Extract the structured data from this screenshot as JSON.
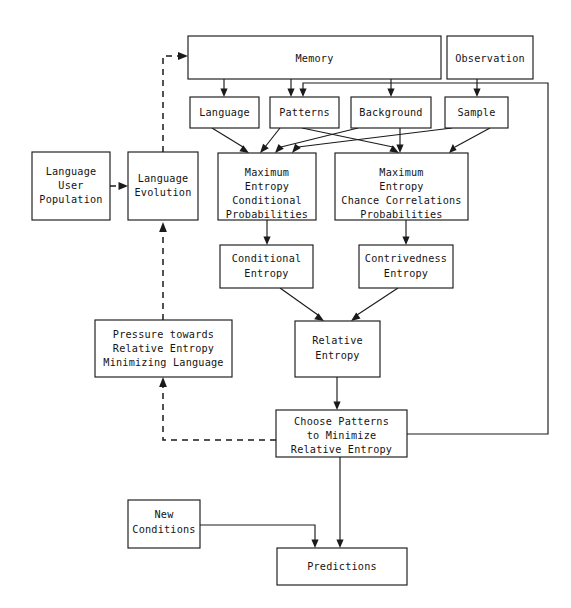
{
  "diagram": {
    "type": "flowchart",
    "canvas": {
      "width": 571,
      "height": 608
    },
    "colors": {
      "background": "#ffffff",
      "stroke": "#1a1a1a",
      "text": "#141414"
    },
    "nodes": [
      {
        "id": "memory",
        "label": "Memory",
        "lines": [
          "Memory"
        ],
        "x": 188,
        "y": 36,
        "w": 253,
        "h": 43
      },
      {
        "id": "observation",
        "label": "Observation",
        "lines": [
          "Observation"
        ],
        "x": 447,
        "y": 36,
        "w": 86,
        "h": 43
      },
      {
        "id": "language",
        "label": "Language",
        "lines": [
          "Language"
        ],
        "x": 190,
        "y": 97,
        "w": 69,
        "h": 31
      },
      {
        "id": "patterns",
        "label": "Patterns",
        "lines": [
          "Patterns"
        ],
        "x": 270,
        "y": 97,
        "w": 69,
        "h": 31
      },
      {
        "id": "background",
        "label": "Background",
        "lines": [
          "Background"
        ],
        "x": 351,
        "y": 97,
        "w": 80,
        "h": 31
      },
      {
        "id": "sample",
        "label": "Sample",
        "lines": [
          "Sample"
        ],
        "x": 445,
        "y": 97,
        "w": 63,
        "h": 31
      },
      {
        "id": "lang-user-pop",
        "label": "Language User Population",
        "lines": [
          "Language",
          "User",
          "Population"
        ],
        "x": 32,
        "y": 152,
        "w": 78,
        "h": 68
      },
      {
        "id": "lang-evol",
        "label": "Language Evolution",
        "lines": [
          "Language",
          "Evolution"
        ],
        "x": 128,
        "y": 152,
        "w": 70,
        "h": 68
      },
      {
        "id": "maxent-cond",
        "label": "Maximum Entropy Conditional Probabilities",
        "lines": [
          "Maximum",
          "Entropy",
          "Conditional",
          "Probabilities"
        ],
        "x": 218,
        "y": 153,
        "w": 98,
        "h": 67
      },
      {
        "id": "maxent-chance",
        "label": "Maximum Entropy Chance Correlations Probabilities",
        "lines": [
          "Maximum",
          "Entropy",
          "Chance Correlations",
          "Probabilities"
        ],
        "x": 335,
        "y": 153,
        "w": 133,
        "h": 67
      },
      {
        "id": "cond-entropy",
        "label": "Conditional Entropy",
        "lines": [
          "Conditional",
          "Entropy"
        ],
        "x": 220,
        "y": 245,
        "w": 93,
        "h": 43
      },
      {
        "id": "contriv-entropy",
        "label": "Contrivedness Entropy",
        "lines": [
          "Contrivedness",
          "Entropy"
        ],
        "x": 359,
        "y": 245,
        "w": 94,
        "h": 43
      },
      {
        "id": "pressure",
        "label": "Pressure towards Relative Entropy Minimizing Language",
        "lines": [
          "Pressure towards",
          "Relative Entropy",
          "Minimizing Language"
        ],
        "x": 95,
        "y": 320,
        "w": 137,
        "h": 57
      },
      {
        "id": "rel-entropy",
        "label": "Relative Entropy",
        "lines": [
          "Relative",
          "Entropy"
        ],
        "x": 295,
        "y": 321,
        "w": 85,
        "h": 56
      },
      {
        "id": "choose-patterns",
        "label": "Choose Patterns to Minimize Relative Entropy",
        "lines": [
          "Choose Patterns",
          "to Minimize",
          "Relative Entropy"
        ],
        "x": 276,
        "y": 410,
        "w": 131,
        "h": 47
      },
      {
        "id": "new-conditions",
        "label": "New Conditions",
        "lines": [
          "New",
          "Conditions"
        ],
        "x": 128,
        "y": 500,
        "w": 72,
        "h": 48
      },
      {
        "id": "predictions",
        "label": "Predictions",
        "lines": [
          "Predictions"
        ],
        "x": 277,
        "y": 548,
        "w": 130,
        "h": 37
      }
    ],
    "edges": [
      {
        "id": "memory-to-language",
        "from": "memory",
        "to": "language",
        "style": "solid",
        "arrow": true
      },
      {
        "id": "memory-to-patterns",
        "from": "memory",
        "to": "patterns",
        "style": "solid",
        "arrow": true
      },
      {
        "id": "memory-to-background",
        "from": "memory",
        "to": "background",
        "style": "solid",
        "arrow": true
      },
      {
        "id": "observation-to-sample",
        "from": "observation",
        "to": "sample",
        "style": "solid",
        "arrow": true
      },
      {
        "id": "language-to-maxent-cond",
        "from": "language",
        "to": "maxent-cond",
        "style": "solid",
        "arrow": true
      },
      {
        "id": "patterns-to-maxent-cond",
        "from": "patterns",
        "to": "maxent-cond",
        "style": "solid",
        "arrow": true
      },
      {
        "id": "patterns-to-maxent-chance",
        "from": "patterns",
        "to": "maxent-chance",
        "style": "solid",
        "arrow": true
      },
      {
        "id": "background-to-maxent-cond",
        "from": "background",
        "to": "maxent-cond",
        "style": "solid",
        "arrow": true
      },
      {
        "id": "background-to-maxent-chance",
        "from": "background",
        "to": "maxent-chance",
        "style": "solid",
        "arrow": true
      },
      {
        "id": "sample-to-maxent-cond",
        "from": "sample",
        "to": "maxent-cond",
        "style": "solid",
        "arrow": true
      },
      {
        "id": "sample-to-maxent-chance",
        "from": "sample",
        "to": "maxent-chance",
        "style": "solid",
        "arrow": true
      },
      {
        "id": "maxent-cond-to-cond-entropy",
        "from": "maxent-cond",
        "to": "cond-entropy",
        "style": "solid",
        "arrow": true
      },
      {
        "id": "maxent-chance-to-contriv-entropy",
        "from": "maxent-chance",
        "to": "contriv-entropy",
        "style": "solid",
        "arrow": true
      },
      {
        "id": "cond-entropy-to-rel-entropy",
        "from": "cond-entropy",
        "to": "rel-entropy",
        "style": "solid",
        "arrow": true
      },
      {
        "id": "contriv-entropy-to-rel-entropy",
        "from": "contriv-entropy",
        "to": "rel-entropy",
        "style": "solid",
        "arrow": true
      },
      {
        "id": "rel-entropy-to-choose-patterns",
        "from": "rel-entropy",
        "to": "choose-patterns",
        "style": "solid",
        "arrow": true
      },
      {
        "id": "choose-patterns-to-predictions",
        "from": "choose-patterns",
        "to": "predictions",
        "style": "solid",
        "arrow": true
      },
      {
        "id": "new-conditions-to-predictions",
        "from": "new-conditions",
        "to": "predictions",
        "style": "solid",
        "arrow": true
      },
      {
        "id": "choose-patterns-feedback-to-patterns",
        "from": "choose-patterns",
        "to": "patterns",
        "style": "solid",
        "arrow": true,
        "routing": "right-up-left-down"
      },
      {
        "id": "lang-user-pop-to-lang-evol",
        "from": "lang-user-pop",
        "to": "lang-evol",
        "style": "dashed",
        "arrow": true
      },
      {
        "id": "lang-evol-to-memory",
        "from": "lang-evol",
        "to": "memory",
        "style": "dashed",
        "arrow": true,
        "routing": "up-right"
      },
      {
        "id": "pressure-to-lang-evol",
        "from": "pressure",
        "to": "lang-evol",
        "style": "dashed",
        "arrow": true
      },
      {
        "id": "choose-patterns-to-pressure",
        "from": "choose-patterns",
        "to": "pressure",
        "style": "dashed",
        "arrow": true,
        "routing": "left-up"
      }
    ]
  }
}
